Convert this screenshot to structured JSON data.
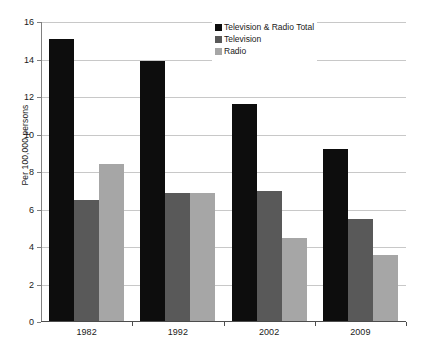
{
  "chart_data": {
    "type": "bar",
    "title": "",
    "xlabel": "",
    "ylabel": "Per 100,000 persons",
    "ylim": [
      0,
      16
    ],
    "ytick_step": 2,
    "yticks": [
      "0",
      "2",
      "4",
      "6",
      "8",
      "10",
      "12",
      "14",
      "16"
    ],
    "grid": true,
    "legend_position": "top-center",
    "categories": [
      "1982",
      "1992",
      "2002",
      "2009"
    ],
    "series": [
      {
        "name": "Television & Radio Total",
        "color": "#0d0d0d",
        "values": [
          15.1,
          13.9,
          11.65,
          9.25
        ]
      },
      {
        "name": "Television",
        "color": "#595959",
        "values": [
          6.5,
          6.9,
          7.0,
          5.5
        ]
      },
      {
        "name": "Radio",
        "color": "#a6a6a6",
        "values": [
          8.45,
          6.9,
          4.5,
          3.6
        ]
      }
    ]
  }
}
